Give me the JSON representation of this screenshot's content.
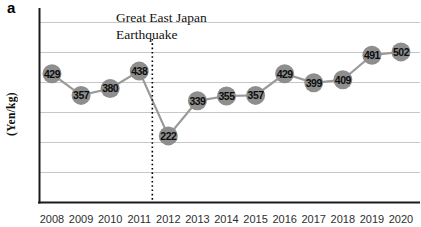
{
  "panel_label": "a",
  "chart_data": {
    "type": "line",
    "title": "",
    "xlabel": "",
    "ylabel": "(Yen/kg)",
    "x": [
      "2008",
      "2009",
      "2010",
      "2011",
      "2012",
      "2013",
      "2014",
      "2015",
      "2016",
      "2017",
      "2018",
      "2019",
      "2020"
    ],
    "values": [
      429,
      357,
      380,
      438,
      222,
      339,
      355,
      357,
      429,
      399,
      409,
      491,
      502
    ],
    "unit": "Yen/kg",
    "ylim": [
      0,
      650
    ],
    "gridline_step": 100,
    "gridline_max": 600,
    "grid": true,
    "legend": "none",
    "point_labels_on_markers": true,
    "annotation": {
      "line1": "Great East Japan",
      "line2": "Earthquake",
      "text": "Great East Japan Earthquake",
      "between_years": [
        "2011",
        "2012"
      ],
      "x_index": 3.45
    },
    "colors": {
      "marker": "#8e8e8e",
      "line": "#9a9a9a",
      "grid": "#c7c7c7",
      "axis": "#1a1a1a",
      "point_label": "#0d0d0d",
      "tick_label": "#2e2e2e",
      "annotation_line": "#000000"
    }
  }
}
